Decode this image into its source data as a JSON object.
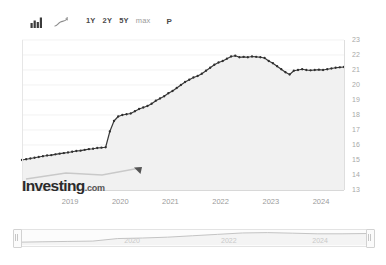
{
  "toolbar": {
    "icons": [
      {
        "name": "bar-chart-icon",
        "label": "Bar chart"
      },
      {
        "name": "line-chart-icon",
        "label": "Line chart"
      }
    ],
    "ranges": [
      {
        "label": "1Y",
        "active": false
      },
      {
        "label": "2Y",
        "active": false
      },
      {
        "label": "5Y",
        "active": false
      },
      {
        "label": "max",
        "active": true
      }
    ],
    "tools": [
      {
        "label": "P",
        "name": "pattern-tool-button"
      }
    ]
  },
  "watermark": {
    "brand": "Investing",
    "suffix": ".com"
  },
  "navigator": {
    "ticks": [
      "2020",
      "2022",
      "2024"
    ],
    "left_handle": "navigator-left-handle",
    "right_handle": "navigator-right-handle"
  },
  "colors": {
    "line": "#333333",
    "area": "#f2f2f2",
    "grid": "#ececec",
    "tick_text": "#a8a8a8",
    "axis": "#dcdcdc"
  },
  "chart_data": {
    "type": "line",
    "title": "",
    "subtitle": "",
    "xlabel": "",
    "ylabel": "",
    "grid": true,
    "legend": false,
    "ylim": [
      13,
      23
    ],
    "yticks": [
      13,
      14,
      15,
      16,
      17,
      18,
      19,
      20,
      21,
      22,
      23
    ],
    "xticks": [
      "2019",
      "2020",
      "2021",
      "2022",
      "2023",
      "2024"
    ],
    "xlim": [
      "2018-07",
      "2024-12"
    ],
    "markers": true,
    "area_fill": true,
    "x": [
      "2018-07",
      "2018-08",
      "2018-09",
      "2018-10",
      "2018-11",
      "2018-12",
      "2019-01",
      "2019-02",
      "2019-03",
      "2019-04",
      "2019-05",
      "2019-06",
      "2019-07",
      "2019-08",
      "2019-09",
      "2019-10",
      "2019-11",
      "2019-12",
      "2020-01",
      "2020-02",
      "2020-03",
      "2020-04",
      "2020-05",
      "2020-06",
      "2020-07",
      "2020-08",
      "2020-09",
      "2020-10",
      "2020-11",
      "2020-12",
      "2021-01",
      "2021-02",
      "2021-03",
      "2021-04",
      "2021-05",
      "2021-06",
      "2021-07",
      "2021-08",
      "2021-09",
      "2021-10",
      "2021-11",
      "2021-12",
      "2022-01",
      "2022-02",
      "2022-03",
      "2022-04",
      "2022-05",
      "2022-06",
      "2022-07",
      "2022-08",
      "2022-09",
      "2022-10",
      "2022-11",
      "2022-12",
      "2023-01",
      "2023-02",
      "2023-03",
      "2023-04",
      "2023-05",
      "2023-06",
      "2023-07",
      "2023-08",
      "2023-09",
      "2023-10",
      "2023-11",
      "2023-12",
      "2024-01",
      "2024-02",
      "2024-03",
      "2024-04",
      "2024-05",
      "2024-06",
      "2024-07",
      "2024-08",
      "2024-09",
      "2024-10",
      "2024-11",
      "2024-12"
    ],
    "values": [
      15.0,
      15.05,
      15.1,
      15.15,
      15.2,
      15.25,
      15.3,
      15.32,
      15.38,
      15.42,
      15.46,
      15.5,
      15.55,
      15.6,
      15.62,
      15.68,
      15.72,
      15.75,
      15.8,
      15.82,
      15.85,
      16.9,
      17.6,
      17.9,
      18.0,
      18.05,
      18.1,
      18.25,
      18.4,
      18.5,
      18.6,
      18.75,
      18.95,
      19.1,
      19.25,
      19.45,
      19.6,
      19.8,
      20.0,
      20.2,
      20.35,
      20.5,
      20.6,
      20.75,
      20.95,
      21.15,
      21.35,
      21.5,
      21.6,
      21.75,
      21.9,
      21.95,
      21.85,
      21.88,
      21.85,
      21.9,
      21.88,
      21.85,
      21.8,
      21.6,
      21.45,
      21.25,
      21.05,
      20.85,
      20.7,
      20.95,
      21.0,
      21.05,
      21.0,
      20.98,
      21.0,
      21.02,
      21.0,
      21.05,
      21.1,
      21.15,
      21.18,
      21.2
    ],
    "navigator_series": {
      "x": [
        "2018-07",
        "2019-01",
        "2019-07",
        "2020-01",
        "2020-04",
        "2020-07",
        "2021-01",
        "2021-07",
        "2022-01",
        "2022-07",
        "2023-01",
        "2023-07",
        "2024-01",
        "2024-07",
        "2024-12"
      ],
      "values": [
        15.0,
        15.3,
        15.55,
        15.8,
        17.6,
        18.0,
        18.6,
        19.6,
        20.6,
        21.6,
        21.85,
        21.45,
        21.0,
        21.0,
        21.2
      ]
    }
  }
}
